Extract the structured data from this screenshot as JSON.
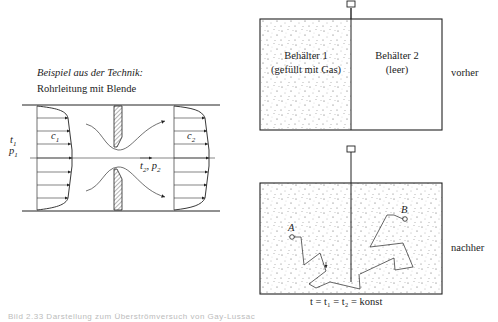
{
  "left_panel": {
    "heading": "Beispiel aus der Technik:",
    "subheading": "Rohrleitung mit Blende",
    "labels": {
      "t1": "t",
      "t1_sub": "1",
      "p1": "p",
      "p1_sub": "1",
      "c1": "c",
      "c1_sub": "1",
      "c2": "c",
      "c2_sub": "2",
      "t2p2": "t",
      "t2p2_sub": "2",
      "t2p2_rest": ", p",
      "t2p2_sub2": "2"
    }
  },
  "right_panel": {
    "top": {
      "container1_line1": "Behälter 1",
      "container1_line2": "(gefüllt mit Gas)",
      "container2_line1": "Behälter 2",
      "container2_line2": "(leer)",
      "state_label": "vorher"
    },
    "bottom": {
      "point_a": "A",
      "point_b": "B",
      "state_label": "nachher",
      "equation": "t = t₁ = t₂ = konst"
    }
  },
  "caption": "Bild 2.33 Darstellung zum Überströmversuch von Gay-Lussac"
}
